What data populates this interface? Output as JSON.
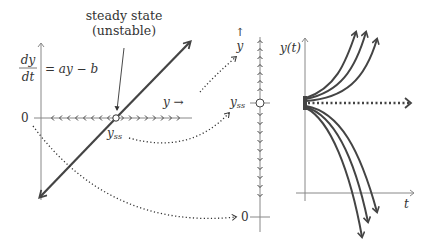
{
  "labels": {
    "steady_state_line1": "steady state",
    "steady_state_line2": "(unstable)",
    "dydt_num": "dy",
    "dydt_den": "dt",
    "equation": "= ay − b",
    "zero_left": "0",
    "y_arrow": "y →",
    "yss_left": "y",
    "yss_sub": "ss",
    "phase_arrow": "↑",
    "phase_y": "y",
    "yss_mid": "y",
    "yss_mid_sub": "ss",
    "zero_mid": "0",
    "yt_label": "y(t)",
    "t_label": "t"
  },
  "panels": [
    {
      "name": "rate-plot",
      "description": "dy/dt vs y, straight line crossing zero at y_ss"
    },
    {
      "name": "phase-line",
      "description": "vertical phase line with arrows away from y_ss"
    },
    {
      "name": "solution-curves",
      "description": "y(t) curves diverging from y_ss"
    }
  ],
  "colors": {
    "line": "#444444",
    "axis": "#888888",
    "text": "#333333"
  }
}
